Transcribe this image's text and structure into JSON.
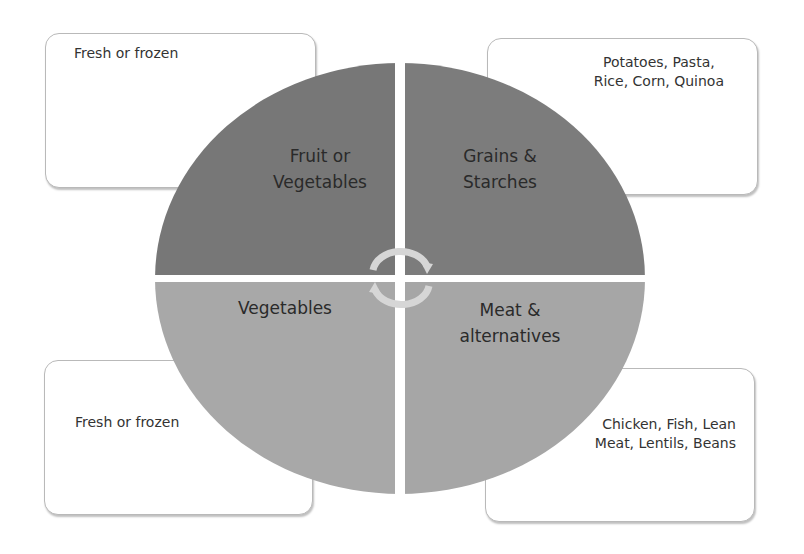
{
  "diagram": {
    "type": "plate-quadrant-diagram",
    "colors": {
      "top_quadrants": "#7a7a7a",
      "bottom_quadrants": "#a9a9a9",
      "divider": "#ffffff",
      "box_border": "#b9b9b9",
      "cycle_arrows": "#d9d9d9"
    },
    "quadrants": [
      {
        "id": "top-left",
        "label": "Fruit or\nVegetables",
        "color": "#777777"
      },
      {
        "id": "top-right",
        "label": "Grains &\nStarches",
        "color": "#7c7c7c"
      },
      {
        "id": "bottom-left",
        "label": "Vegetables",
        "color": "#a8a8a8"
      },
      {
        "id": "bottom-right",
        "label": "Meat &\nalternatives",
        "color": "#a6a6a6"
      }
    ],
    "notes": [
      {
        "id": "top-left",
        "text": "Fresh or frozen"
      },
      {
        "id": "top-right",
        "text": "Potatoes, Pasta,\nRice, Corn, Quinoa"
      },
      {
        "id": "bottom-left",
        "text": "Fresh or frozen"
      },
      {
        "id": "bottom-right",
        "text": "Chicken, Fish, Lean\nMeat, Lentils, Beans"
      }
    ],
    "center_icon": "cycle-arrows-icon"
  }
}
